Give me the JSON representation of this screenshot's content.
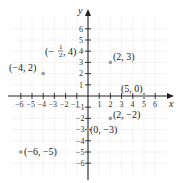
{
  "diagram": {
    "type": "coordinate-plane",
    "x_axis_label": "x",
    "y_axis_label": "y",
    "x_range": [
      -6,
      6
    ],
    "y_range": [
      -6,
      6
    ],
    "x_ticks": [
      "-6",
      "-5",
      "-4",
      "-3",
      "-2",
      "-1",
      "1",
      "2",
      "3",
      "4",
      "5",
      "6"
    ],
    "y_ticks": [
      "6",
      "5",
      "4",
      "3",
      "2",
      "1",
      "-1",
      "-2",
      "-3",
      "-4",
      "-5",
      "-6"
    ],
    "points": [
      {
        "label": "(2, 3)",
        "x": 2,
        "y": 3
      },
      {
        "label": "(-4, 2)",
        "x": -4,
        "y": 2
      },
      {
        "label": "(5, 0)",
        "x": 5,
        "y": 0
      },
      {
        "label": "(2, -2)",
        "x": 2,
        "y": -2
      },
      {
        "label": "(0, -3)",
        "x": 0,
        "y": -3
      },
      {
        "label": "(-6, -5)",
        "x": -6,
        "y": -5
      },
      {
        "label": "(-1/2, 4)",
        "x": -0.5,
        "y": 4
      }
    ],
    "colors": {
      "axis": "#222222",
      "grid": "#d8d8d8",
      "point": "#9a9a9a"
    }
  },
  "labels": {
    "x": "x",
    "y": "y",
    "p23": "(2, 3)",
    "pm42": "(−4, 2)",
    "p50": "(5, 0)",
    "p2m2": "(2, −2)",
    "p0m3": "(0, −3)",
    "pm6m5": "(−6, −5)",
    "half_open": "(−",
    "half_num": "1",
    "half_den": "2",
    "half_close": ", 4)",
    "tx": {
      "m6": "−6",
      "m5": "−5",
      "m4": "−4",
      "m3": "−3",
      "m2": "−2",
      "m1": "−1",
      "p1": "1",
      "p2": "2",
      "p3": "3",
      "p4": "4",
      "p5": "5",
      "p6": "6"
    },
    "ty": {
      "p6": "6",
      "p5": "5",
      "p4": "4",
      "p3": "3",
      "p2": "2",
      "p1": "1",
      "m1": "−1",
      "m2": "−2",
      "m3": "−3",
      "m4": "−4",
      "m5": "−5",
      "m6": "−6"
    }
  }
}
